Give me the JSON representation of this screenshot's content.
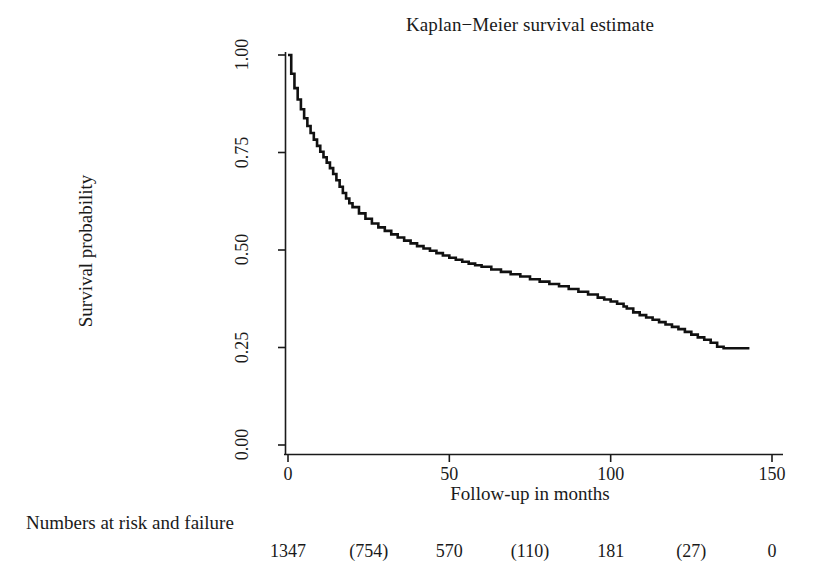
{
  "chart_data": {
    "type": "line",
    "title": "Kaplan−Meier survival estimate",
    "xlabel": "Follow-up in months",
    "ylabel": "Survival probability",
    "xlim": [
      0,
      150
    ],
    "ylim": [
      0,
      1.0
    ],
    "grid": false,
    "legend": null,
    "xticks": [
      0,
      50,
      100,
      150
    ],
    "xtick_labels": [
      "0",
      "50",
      "100",
      "150"
    ],
    "yticks": [
      0.0,
      0.25,
      0.5,
      0.75,
      1.0
    ],
    "ytick_labels": [
      "0.00",
      "0.25",
      "0.50",
      "0.75",
      "1.00"
    ],
    "series": [
      {
        "name": "Kaplan-Meier survival estimate",
        "step": "post",
        "color": "#111111",
        "x": [
          0,
          1,
          2,
          3,
          4,
          5,
          6,
          7,
          8,
          9,
          10,
          11,
          12,
          13,
          14,
          15,
          16,
          17,
          18,
          19,
          20,
          22,
          24,
          26,
          28,
          30,
          32,
          34,
          36,
          38,
          40,
          42,
          44,
          46,
          48,
          50,
          52,
          54,
          56,
          58,
          60,
          63,
          66,
          69,
          72,
          75,
          78,
          81,
          84,
          87,
          90,
          93,
          96,
          98,
          100,
          102,
          104,
          105,
          107,
          109,
          111,
          113,
          115,
          117,
          119,
          121,
          123,
          125,
          127,
          129,
          131,
          133,
          135,
          137,
          139,
          141,
          143
        ],
        "y": [
          1.0,
          0.952,
          0.915,
          0.886,
          0.861,
          0.838,
          0.818,
          0.8,
          0.783,
          0.767,
          0.752,
          0.738,
          0.724,
          0.71,
          0.695,
          0.679,
          0.662,
          0.646,
          0.632,
          0.62,
          0.61,
          0.594,
          0.58,
          0.568,
          0.558,
          0.549,
          0.54,
          0.532,
          0.524,
          0.517,
          0.51,
          0.504,
          0.498,
          0.492,
          0.486,
          0.48,
          0.475,
          0.47,
          0.465,
          0.461,
          0.457,
          0.45,
          0.444,
          0.438,
          0.432,
          0.425,
          0.419,
          0.413,
          0.407,
          0.4,
          0.393,
          0.386,
          0.378,
          0.373,
          0.368,
          0.362,
          0.355,
          0.35,
          0.34,
          0.333,
          0.327,
          0.321,
          0.315,
          0.309,
          0.303,
          0.297,
          0.29,
          0.283,
          0.276,
          0.27,
          0.262,
          0.252,
          0.248,
          0.248,
          0.248,
          0.248,
          0.248
        ]
      }
    ],
    "numbers_at_risk_caption": "Numbers at risk and failure",
    "numbers_at_risk_positions": [
      0,
      25,
      50,
      75,
      100,
      125,
      150
    ],
    "numbers_at_risk_values": [
      "1347",
      "(754)",
      "570",
      "(110)",
      "181",
      "(27)",
      "0"
    ]
  }
}
